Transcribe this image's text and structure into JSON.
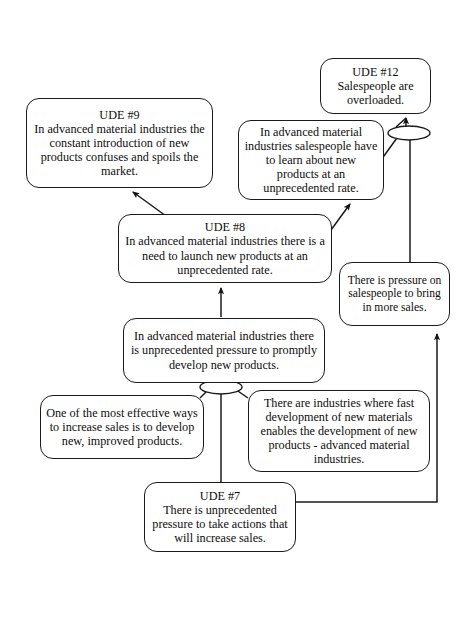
{
  "diagram": {
    "type": "current-reality-tree",
    "background_color": "#ffffff",
    "line_color": "#1a1a1a",
    "box_fill": "#ffffff",
    "nodes": [
      {
        "id": "ude9",
        "title": "UDE #9",
        "text": "In advanced material industries the constant introduction of new products confuses and spoils the market."
      },
      {
        "id": "ude12",
        "title": "UDE #12",
        "text": "Salespeople are overloaded."
      },
      {
        "id": "salespeople-learn",
        "title": "",
        "text": "In advanced material industries salespeople have to learn about new products at an unprecedented rate."
      },
      {
        "id": "ude8",
        "title": "UDE #8",
        "text": "In advanced material industries there is a need to launch new products at an unprecedented rate."
      },
      {
        "id": "pressure-salespeople",
        "title": "",
        "text": "There is pressure on salespeople to bring in more sales."
      },
      {
        "id": "develop-pressure",
        "title": "",
        "text": "In advanced material industries there is unprecedented pressure to promptly develop new products."
      },
      {
        "id": "effective-ways",
        "title": "",
        "text": "One of the most effective ways to increase sales is to develop new, improved products."
      },
      {
        "id": "fast-development",
        "title": "",
        "text": "There are industries where fast development of new materials enables the development of new products - advanced material industries."
      },
      {
        "id": "ude7",
        "title": "UDE #7",
        "text": "There is unprecedented pressure to take actions that will increase sales."
      }
    ],
    "junctions": [
      {
        "id": "and-junction-upper",
        "label": "and-ellipse"
      },
      {
        "id": "and-junction-lower",
        "label": "and-ellipse"
      }
    ],
    "edges": [
      {
        "from": "ude8",
        "to": "ude9"
      },
      {
        "from": "ude8",
        "to": "salespeople-learn"
      },
      {
        "from": "salespeople-learn",
        "to": "ude12"
      },
      {
        "from": "pressure-salespeople",
        "to": "ude12"
      },
      {
        "from": "develop-pressure",
        "to": "ude8"
      },
      {
        "from": "effective-ways",
        "to": "develop-pressure"
      },
      {
        "from": "ude7",
        "to": "develop-pressure"
      },
      {
        "from": "fast-development",
        "to": "develop-pressure"
      },
      {
        "from": "ude7",
        "to": "pressure-salespeople"
      }
    ]
  }
}
